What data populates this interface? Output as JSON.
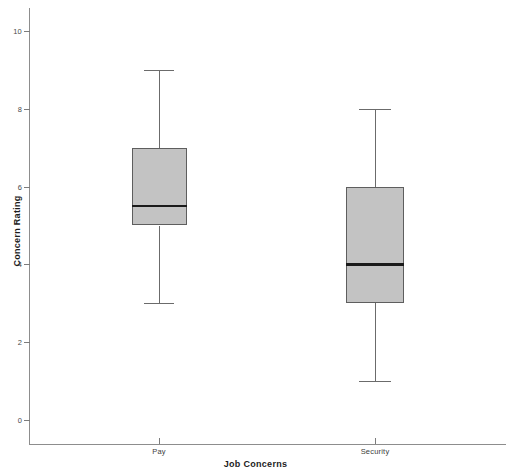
{
  "chart_data": {
    "type": "box",
    "title": "",
    "xlabel": "Job Concerns",
    "ylabel": "Concern Rating",
    "categories": [
      "Pay",
      "Security"
    ],
    "ylim": [
      0,
      10.5
    ],
    "yticks": [
      0,
      2,
      4,
      6,
      8,
      10
    ],
    "ytick_labels": [
      "0",
      "2",
      "4",
      "6",
      "8",
      "10"
    ],
    "grid": false,
    "legend": false,
    "box_fill_color": "#c3c3c3",
    "box_edge_color": "#5e5e5e",
    "median_color": "#1a1a1a",
    "whisker_color": "#6b6b6b",
    "background_color": "#ffffff",
    "boxes": [
      {
        "category": "Pay",
        "whisker_low": 3,
        "q1": 5,
        "median": 5.5,
        "q3": 7,
        "whisker_high": 9,
        "outliers": []
      },
      {
        "category": "Security",
        "whisker_low": 1,
        "q1": 3,
        "median": 4,
        "q3": 6,
        "whisker_high": 8,
        "outliers": []
      }
    ]
  }
}
